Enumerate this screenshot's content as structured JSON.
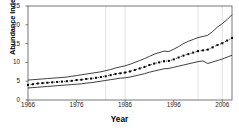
{
  "figure": {
    "background": "#ffffff",
    "axis_color": "#555555",
    "series_color": "#000000",
    "grid_color": "#cccccc"
  },
  "axis_titles": {
    "x": "Year",
    "y": "Abundance Index"
  },
  "chart_data": {
    "type": "line",
    "title": "",
    "xlabel": "Year",
    "ylabel": "Abundance Index",
    "xlim": [
      1966,
      2008
    ],
    "ylim": [
      0,
      25
    ],
    "xticks": [
      1966,
      1976,
      1986,
      1996,
      2006
    ],
    "yticks": [
      0,
      5,
      10,
      15,
      20,
      25
    ],
    "grid": "vertical-only",
    "gridlines_x": [
      1982,
      1986,
      2001,
      2006
    ],
    "legend": "none",
    "x": [
      1966,
      1967,
      1968,
      1969,
      1970,
      1971,
      1972,
      1973,
      1974,
      1975,
      1976,
      1977,
      1978,
      1979,
      1980,
      1981,
      1982,
      1983,
      1984,
      1985,
      1986,
      1987,
      1988,
      1989,
      1990,
      1991,
      1992,
      1993,
      1994,
      1995,
      1996,
      1997,
      1998,
      1999,
      2000,
      2001,
      2002,
      2003,
      2004,
      2005,
      2006,
      2007,
      2008
    ],
    "series": [
      {
        "name": "Abundance index (point estimate)",
        "style": "dotted-markers",
        "values": [
          4.0,
          4.2,
          4.4,
          4.5,
          4.6,
          4.7,
          4.8,
          4.9,
          5.0,
          5.1,
          5.3,
          5.4,
          5.6,
          5.7,
          5.9,
          6.1,
          6.3,
          6.6,
          6.9,
          7.1,
          7.3,
          7.6,
          8.0,
          8.4,
          8.8,
          9.3,
          9.7,
          10.0,
          10.3,
          10.4,
          10.8,
          11.3,
          11.8,
          12.2,
          12.6,
          13.0,
          13.2,
          13.4,
          14.0,
          14.6,
          15.1,
          15.8,
          16.5
        ]
      },
      {
        "name": "Upper confidence limit",
        "style": "solid-line",
        "values": [
          5.3,
          5.4,
          5.5,
          5.6,
          5.7,
          5.8,
          5.9,
          6.0,
          6.1,
          6.3,
          6.5,
          6.7,
          6.9,
          7.1,
          7.3,
          7.5,
          7.8,
          8.1,
          8.5,
          8.8,
          9.1,
          9.5,
          10.0,
          10.5,
          11.0,
          11.6,
          12.2,
          12.6,
          13.0,
          12.9,
          13.5,
          14.2,
          15.0,
          15.6,
          16.1,
          16.6,
          16.9,
          17.2,
          18.2,
          19.4,
          20.3,
          21.4,
          22.7
        ]
      },
      {
        "name": "Lower confidence limit",
        "style": "solid-line",
        "values": [
          3.2,
          3.3,
          3.4,
          3.5,
          3.6,
          3.7,
          3.8,
          3.9,
          4.0,
          4.1,
          4.2,
          4.3,
          4.5,
          4.6,
          4.8,
          5.0,
          5.2,
          5.4,
          5.6,
          5.8,
          5.9,
          6.1,
          6.4,
          6.7,
          7.0,
          7.4,
          7.7,
          8.0,
          8.3,
          8.4,
          8.7,
          9.0,
          9.3,
          9.6,
          9.9,
          10.2,
          10.4,
          9.7,
          10.1,
          10.5,
          10.9,
          11.4,
          11.9
        ]
      }
    ]
  }
}
